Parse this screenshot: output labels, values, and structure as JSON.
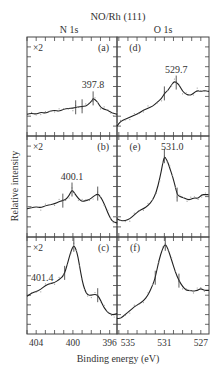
{
  "chart_data": {
    "type": "line",
    "title": "NO/Rh (111)",
    "xlabel": "Binding energy (eV)",
    "ylabel": "Relative intensity",
    "columns": [
      {
        "name": "N 1s",
        "xlim": [
          405.0,
          395.2
        ],
        "ticks": [
          404,
          400,
          396
        ],
        "minor_step": 1
      },
      {
        "name": "O 1s",
        "xlim": [
          536.2,
          526.1
        ],
        "ticks": [
          535,
          531,
          527
        ],
        "minor_step": 1
      }
    ],
    "ylim": [
      0,
      1
    ],
    "grid": false,
    "panels": [
      {
        "id": "a",
        "label": "(a)",
        "column": 0,
        "row": 0,
        "multiplier": "×2",
        "peak_label": "397.8",
        "peak_x": 397.8,
        "markers": [
          399.7,
          399.0,
          397.8
        ],
        "x": [
          405.0,
          404.5,
          404.0,
          403.5,
          403.0,
          402.5,
          402.0,
          401.5,
          401.0,
          400.5,
          400.0,
          399.7,
          399.5,
          399.0,
          398.6,
          398.2,
          397.9,
          397.8,
          397.6,
          397.3,
          397.0,
          396.6,
          396.2,
          395.9,
          395.6,
          395.2
        ],
        "y": [
          0.22,
          0.23,
          0.22,
          0.24,
          0.23,
          0.25,
          0.26,
          0.25,
          0.27,
          0.28,
          0.28,
          0.29,
          0.29,
          0.3,
          0.3,
          0.33,
          0.36,
          0.38,
          0.37,
          0.34,
          0.29,
          0.27,
          0.26,
          0.24,
          0.23,
          0.22
        ]
      },
      {
        "id": "b",
        "label": "(b)",
        "column": 0,
        "row": 1,
        "multiplier": "×2",
        "peak_label": "400.1",
        "peak_x": 400.1,
        "markers": [
          401.1,
          400.1,
          397.3
        ],
        "x": [
          405.0,
          404.5,
          404.0,
          403.5,
          403.0,
          402.5,
          402.0,
          401.5,
          401.1,
          400.8,
          400.4,
          400.1,
          399.8,
          399.4,
          399.0,
          398.6,
          398.2,
          397.8,
          397.3,
          397.0,
          396.6,
          396.2,
          395.9,
          395.6,
          395.2
        ],
        "y": [
          0.28,
          0.29,
          0.3,
          0.29,
          0.31,
          0.32,
          0.33,
          0.35,
          0.36,
          0.37,
          0.41,
          0.47,
          0.43,
          0.38,
          0.35,
          0.36,
          0.37,
          0.4,
          0.43,
          0.4,
          0.33,
          0.24,
          0.18,
          0.15,
          0.14
        ]
      },
      {
        "id": "c",
        "label": "(c)",
        "column": 0,
        "row": 2,
        "multiplier": "×2",
        "peak_label": "401.4",
        "peak_x": 399.9,
        "markers": [
          400.9,
          399.9,
          397.3
        ],
        "x": [
          405.0,
          404.5,
          404.0,
          403.5,
          403.0,
          402.5,
          402.0,
          401.5,
          401.0,
          400.6,
          400.2,
          399.9,
          399.6,
          399.3,
          399.0,
          398.7,
          398.4,
          398.0,
          397.6,
          397.3,
          397.0,
          396.6,
          396.2,
          395.8,
          395.5,
          395.2
        ],
        "y": [
          0.39,
          0.42,
          0.44,
          0.46,
          0.5,
          0.52,
          0.53,
          0.56,
          0.6,
          0.72,
          0.86,
          0.92,
          0.86,
          0.72,
          0.55,
          0.45,
          0.4,
          0.4,
          0.41,
          0.4,
          0.35,
          0.27,
          0.22,
          0.2,
          0.2,
          0.21
        ]
      },
      {
        "id": "d",
        "label": "(d)",
        "column": 1,
        "row": 0,
        "peak_label": "529.7",
        "peak_x": 529.7,
        "markers": [
          531.0,
          529.7
        ],
        "x": [
          536.2,
          535.8,
          535.3,
          534.8,
          534.3,
          533.8,
          533.3,
          532.8,
          532.3,
          531.8,
          531.3,
          531.0,
          530.6,
          530.2,
          529.9,
          529.7,
          529.4,
          529.0,
          528.6,
          528.2,
          527.8,
          527.4,
          527.0,
          526.6,
          526.1
        ],
        "y": [
          0.1,
          0.15,
          0.17,
          0.19,
          0.21,
          0.23,
          0.26,
          0.28,
          0.3,
          0.34,
          0.38,
          0.43,
          0.46,
          0.52,
          0.55,
          0.54,
          0.52,
          0.45,
          0.42,
          0.41,
          0.43,
          0.46,
          0.45,
          0.46,
          0.45
        ]
      },
      {
        "id": "e",
        "label": "(e)",
        "column": 1,
        "row": 1,
        "peak_label": "531.0",
        "peak_x": 531.0,
        "markers": [
          531.0,
          529.6
        ],
        "x": [
          536.2,
          535.8,
          535.3,
          534.8,
          534.3,
          533.8,
          533.3,
          532.8,
          532.3,
          531.9,
          531.5,
          531.2,
          531.0,
          530.7,
          530.4,
          530.1,
          529.8,
          529.6,
          529.3,
          528.9,
          528.5,
          528.1,
          527.7,
          527.3,
          526.9,
          526.5,
          526.1
        ],
        "y": [
          0.18,
          0.16,
          0.16,
          0.18,
          0.22,
          0.26,
          0.28,
          0.31,
          0.36,
          0.44,
          0.58,
          0.72,
          0.8,
          0.76,
          0.68,
          0.6,
          0.5,
          0.42,
          0.4,
          0.39,
          0.37,
          0.37,
          0.39,
          0.38,
          0.42,
          0.42,
          0.42
        ]
      },
      {
        "id": "f",
        "label": "(f)",
        "column": 1,
        "row": 2,
        "peak_label": "",
        "peak_x": 530.9,
        "markers": [
          530.9,
          532.0,
          529.4
        ],
        "x": [
          536.2,
          535.8,
          535.3,
          534.8,
          534.3,
          533.8,
          533.3,
          532.8,
          532.3,
          532.0,
          531.6,
          531.2,
          530.9,
          530.6,
          530.2,
          529.8,
          529.4,
          529.0,
          528.6,
          528.2,
          527.8,
          527.4,
          527.0,
          526.6,
          526.1
        ],
        "y": [
          0.16,
          0.16,
          0.2,
          0.24,
          0.28,
          0.31,
          0.34,
          0.4,
          0.5,
          0.58,
          0.76,
          0.88,
          0.93,
          0.88,
          0.76,
          0.64,
          0.55,
          0.49,
          0.45,
          0.45,
          0.44,
          0.45,
          0.47,
          0.45,
          0.45
        ]
      }
    ]
  }
}
